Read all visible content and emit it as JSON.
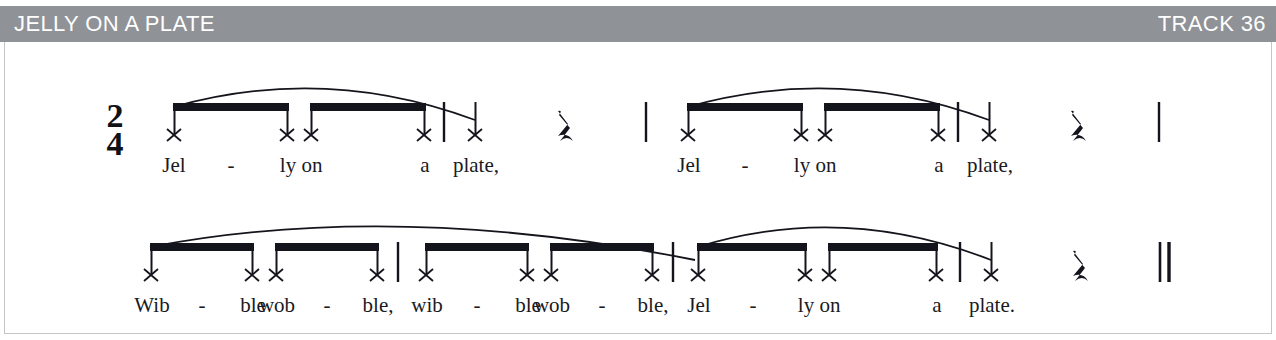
{
  "header": {
    "title": "JELLY ON A PLATE",
    "track_label": "TRACK 36",
    "bar_color": "#8f9296",
    "text_color": "#ffffff"
  },
  "score": {
    "time_signature": {
      "numerator": "2",
      "denominator": "4"
    },
    "ink_color": "#14141c",
    "frame_border_color": "#c3c5c7",
    "rest_glyph": "ᴓE",
    "notehead_glyph": "x",
    "systems": [
      {
        "id": "system-1",
        "measures": [
          {
            "id": "m1",
            "notes": [
              {
                "syllable": "Jel",
                "hyphen": true,
                "duration": "eighth"
              },
              {
                "syllable": "ly",
                "hyphen": false,
                "duration": "eighth"
              },
              {
                "syllable": "on",
                "hyphen": false,
                "duration": "eighth"
              },
              {
                "syllable": "a",
                "hyphen": false,
                "duration": "eighth"
              }
            ]
          },
          {
            "id": "m2",
            "notes": [
              {
                "syllable": "plate,",
                "hyphen": false,
                "duration": "quarter"
              },
              {
                "syllable": "",
                "hyphen": false,
                "duration": "quarter-rest"
              }
            ]
          },
          {
            "id": "m3",
            "notes": [
              {
                "syllable": "Jel",
                "hyphen": true,
                "duration": "eighth"
              },
              {
                "syllable": "ly",
                "hyphen": false,
                "duration": "eighth"
              },
              {
                "syllable": "on",
                "hyphen": false,
                "duration": "eighth"
              },
              {
                "syllable": "a",
                "hyphen": false,
                "duration": "eighth"
              }
            ]
          },
          {
            "id": "m4",
            "notes": [
              {
                "syllable": "plate,",
                "hyphen": false,
                "duration": "quarter"
              },
              {
                "syllable": "",
                "hyphen": false,
                "duration": "quarter-rest"
              }
            ]
          }
        ]
      },
      {
        "id": "system-2",
        "measures": [
          {
            "id": "m5",
            "notes": [
              {
                "syllable": "Wib",
                "hyphen": true,
                "duration": "eighth"
              },
              {
                "syllable": "ble",
                "hyphen": false,
                "duration": "eighth"
              },
              {
                "syllable": "wob",
                "hyphen": true,
                "duration": "eighth"
              },
              {
                "syllable": "ble,",
                "hyphen": false,
                "duration": "eighth"
              }
            ]
          },
          {
            "id": "m6",
            "notes": [
              {
                "syllable": "wib",
                "hyphen": true,
                "duration": "eighth"
              },
              {
                "syllable": "ble",
                "hyphen": false,
                "duration": "eighth"
              },
              {
                "syllable": "wob",
                "hyphen": true,
                "duration": "eighth"
              },
              {
                "syllable": "ble,",
                "hyphen": false,
                "duration": "eighth"
              }
            ]
          },
          {
            "id": "m7",
            "notes": [
              {
                "syllable": "Jel",
                "hyphen": true,
                "duration": "eighth"
              },
              {
                "syllable": "ly",
                "hyphen": false,
                "duration": "eighth"
              },
              {
                "syllable": "on",
                "hyphen": false,
                "duration": "eighth"
              },
              {
                "syllable": "a",
                "hyphen": false,
                "duration": "eighth"
              }
            ]
          },
          {
            "id": "m8",
            "notes": [
              {
                "syllable": "plate.",
                "hyphen": false,
                "duration": "quarter"
              },
              {
                "syllable": "",
                "hyphen": false,
                "duration": "quarter-rest"
              }
            ]
          }
        ]
      }
    ],
    "lyrics_line_1": [
      "Jel",
      "-",
      "ly",
      "on",
      "a",
      "plate,",
      "Jel",
      "-",
      "ly",
      "on",
      "a",
      "plate,"
    ],
    "lyrics_line_2": [
      "Wib",
      "-",
      "ble",
      "wob",
      "-",
      "ble,",
      "wib",
      "-",
      "ble",
      "wob",
      "-",
      "ble,",
      "Jel",
      "-",
      "ly",
      "on",
      "a",
      "plate."
    ]
  }
}
